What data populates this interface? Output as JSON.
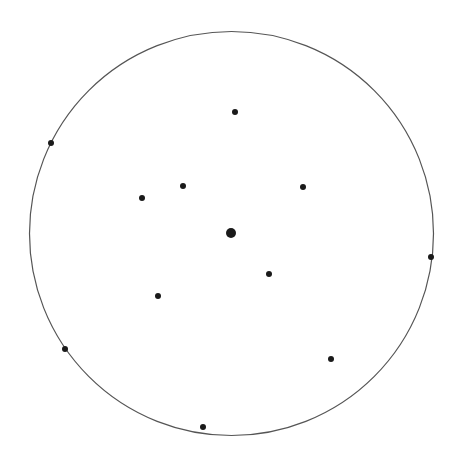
{
  "diagram": {
    "width": 457,
    "height": 463,
    "background": "#ffffff",
    "circle": {
      "cx": 231.5,
      "cy": 233.5,
      "r": 202,
      "stroke": "#555555",
      "stroke_width": 1.2
    },
    "center_point": {
      "x": 231,
      "y": 233,
      "r": 5,
      "color": "#1a1a1a"
    },
    "points_color": "#1a1a1a",
    "point_radius": 3,
    "points": [
      {
        "x": 235,
        "y": 112
      },
      {
        "x": 51,
        "y": 143
      },
      {
        "x": 183,
        "y": 186
      },
      {
        "x": 142,
        "y": 198
      },
      {
        "x": 303,
        "y": 187
      },
      {
        "x": 431,
        "y": 257
      },
      {
        "x": 269,
        "y": 274
      },
      {
        "x": 158,
        "y": 296
      },
      {
        "x": 65,
        "y": 349
      },
      {
        "x": 331,
        "y": 359
      },
      {
        "x": 203,
        "y": 427
      }
    ]
  }
}
